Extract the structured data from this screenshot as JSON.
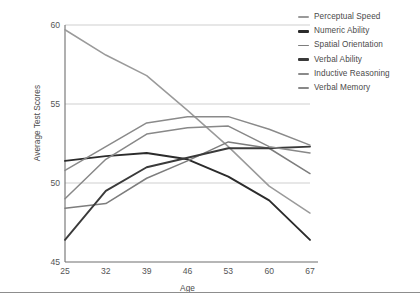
{
  "chart_data": {
    "type": "line",
    "title": "",
    "xlabel": "Age",
    "ylabel": "Average Test Scores",
    "x": [
      25,
      32,
      39,
      46,
      53,
      60,
      67
    ],
    "xtick_labels": [
      "25",
      "32",
      "39",
      "46",
      "53",
      "60",
      "67"
    ],
    "ytick_labels": [
      "45",
      "50",
      "55",
      "60"
    ],
    "yticks": [
      45,
      50,
      55,
      60
    ],
    "ylim": [
      45,
      60
    ],
    "xlim": [
      25,
      67
    ],
    "grid": "horizontal",
    "legend_position": "top-right",
    "series": [
      {
        "name": "Perceptual Speed",
        "color": "#9a9a9a",
        "width": 1.5,
        "values": [
          59.7,
          58.1,
          56.8,
          54.6,
          52.3,
          49.8,
          48.1
        ]
      },
      {
        "name": "Numeric Ability",
        "color": "#2b2b2b",
        "width": 1.9,
        "values": [
          51.4,
          51.7,
          51.9,
          51.5,
          50.4,
          48.9,
          46.4
        ]
      },
      {
        "name": "Spatial Orientation",
        "color": "#7d7d7d",
        "width": 1.5,
        "values": [
          48.4,
          48.7,
          50.3,
          51.4,
          52.6,
          52.2,
          50.6
        ]
      },
      {
        "name": "Verbal Ability",
        "color": "#3a3a3a",
        "width": 1.9,
        "values": [
          46.4,
          49.5,
          51.0,
          51.6,
          52.2,
          52.2,
          52.3
        ]
      },
      {
        "name": "Inductive Reasoning",
        "color": "#8a8a8a",
        "width": 1.5,
        "values": [
          50.8,
          52.3,
          53.8,
          54.2,
          54.2,
          53.4,
          52.4
        ]
      },
      {
        "name": "Verbal Memory",
        "color": "#888888",
        "width": 1.5,
        "values": [
          49.0,
          51.5,
          53.1,
          53.5,
          53.6,
          52.3,
          51.9
        ]
      }
    ]
  },
  "axes": {
    "ylabel": "Average Test Scores",
    "xlabel": "Age",
    "ytick_labels": [
      "60",
      "55",
      "50",
      "45"
    ],
    "xtick_labels": [
      "25",
      "32",
      "39",
      "46",
      "53",
      "60",
      "67"
    ]
  },
  "legend": {
    "items": [
      {
        "label": "Perceptual Speed",
        "color": "#9a9a9a",
        "thick": false
      },
      {
        "label": "Numeric Ability",
        "color": "#2b2b2b",
        "thick": true
      },
      {
        "label": "Spatial Orientation",
        "color": "#7d7d7d",
        "thick": false
      },
      {
        "label": "Verbal Ability",
        "color": "#3a3a3a",
        "thick": true
      },
      {
        "label": "Inductive Reasoning",
        "color": "#8a8a8a",
        "thick": false
      },
      {
        "label": "Verbal Memory",
        "color": "#888888",
        "thick": false
      }
    ]
  },
  "colors": {
    "axis": "#6f6f6f",
    "grid": "#c9c9c9",
    "text": "#4a4a4a",
    "background": "#ffffff"
  }
}
